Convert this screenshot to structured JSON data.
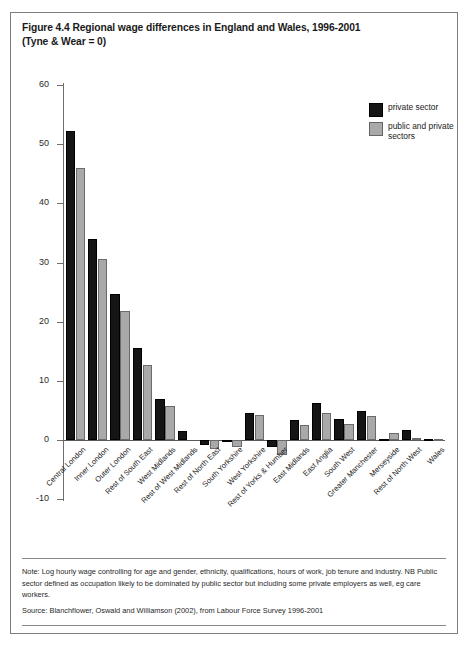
{
  "figure": {
    "title_line1": "Figure 4.4 Regional wage differences in England and Wales, 1996-2001",
    "title_line2": "(Tyne & Wear = 0)",
    "note": "Note: Log hourly wage controlling for age and gender, ethnicity, qualifications, hours of work, job tenure and industry. NB Public sector defined as occupation likely to be dominated by public sector but including some private employers as well, eg care workers.",
    "source": "Source: Blanchflower, Oswald and Williamson (2002), from Labour Force Survey 1996-2001"
  },
  "legend": {
    "position": "top-right",
    "items": [
      {
        "label": "private sector",
        "color": "#151515"
      },
      {
        "label": "public and private sectors",
        "color": "#a9a9a9"
      }
    ]
  },
  "chart_data": {
    "type": "bar",
    "title": "Figure 4.4 Regional wage differences in England and Wales, 1996-2001 (Tyne & Wear = 0)",
    "xlabel": "",
    "ylabel": "",
    "ylim": [
      -10,
      60
    ],
    "yticks": [
      -10,
      0,
      10,
      20,
      30,
      40,
      50,
      60
    ],
    "ytick_labels": [
      "-10",
      "0",
      "10",
      "20",
      "30",
      "40",
      "50",
      "60"
    ],
    "grid": false,
    "legend_position": "upper right",
    "categories": [
      "Central London",
      "Inner London",
      "Outer London",
      "Rest of South East",
      "West Midlands",
      "Rest of West Midlands",
      "Rest of North East",
      "South Yorkshire",
      "West Yorkshire",
      "Rest of Yorks & Humber",
      "East Midlands",
      "East Anglia",
      "South West",
      "Greater Manchester",
      "Merseyside",
      "Rest of North West",
      "Wales"
    ],
    "series": [
      {
        "name": "private sector",
        "color": "#151515",
        "values": [
          52.3,
          34.0,
          24.6,
          15.5,
          6.9,
          1.6,
          -0.8,
          -0.2,
          4.6,
          -1.1,
          3.3,
          6.2,
          3.6,
          4.9,
          0.2,
          1.7,
          0.1
        ]
      },
      {
        "name": "public and private sectors",
        "color": "#a9a9a9",
        "values": [
          45.9,
          30.6,
          21.8,
          12.7,
          5.8,
          0.0,
          -1.5,
          -1.2,
          4.3,
          -2.6,
          2.5,
          4.5,
          2.7,
          4.0,
          1.2,
          0.3,
          0.2
        ]
      }
    ]
  }
}
